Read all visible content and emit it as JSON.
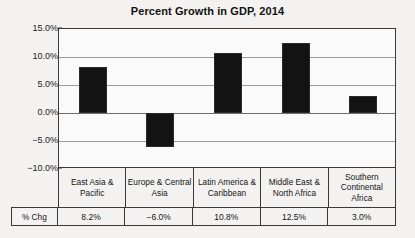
{
  "chart_data": {
    "type": "bar",
    "title": "Percent Growth in GDP, 2014",
    "xlabel": "",
    "ylabel": "",
    "categories": [
      "East Asia & Pacific",
      "Europe & Central Asia",
      "Latin America & Caribbean",
      "Middle East & North Africa",
      "Southern Continental Africa"
    ],
    "values": [
      8.2,
      -6.0,
      10.8,
      12.5,
      3.0
    ],
    "value_labels": [
      "8.2%",
      "−6.0%",
      "10.8%",
      "12.5%",
      "3.0%"
    ],
    "ylim": [
      -10.0,
      15.0
    ],
    "yticks": [
      15.0,
      10.0,
      5.0,
      0.0,
      -5.0,
      -10.0
    ],
    "ytick_labels": [
      "15.0%",
      "10.0%",
      "5.0%",
      "0.0%",
      "−5.0%",
      "−10.0%"
    ],
    "grid": true,
    "legend": false,
    "bar_color": "#131313",
    "axis_color": "#3a3a3a",
    "grid_color": "#9a9a9a"
  },
  "table": {
    "row_label": "% Chg",
    "headers": [
      "East Asia & Pacific",
      "Europe & Central Asia",
      "Latin America & Caribbean",
      "Middle East & North Africa",
      "Southern Continental Africa"
    ],
    "values": [
      "8.2%",
      "−6.0%",
      "10.8%",
      "12.5%",
      "3.0%"
    ]
  }
}
